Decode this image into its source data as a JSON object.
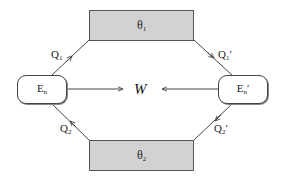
{
  "diagram": {
    "type": "heat-engine-cycle",
    "colors": {
      "reservoir_fill": "#d2d2d2",
      "border": "#555555",
      "line": "#444444",
      "background": "#ffffff"
    },
    "reservoirs": [
      {
        "id": "hot",
        "symbol": "θ",
        "subscript": "1"
      },
      {
        "id": "cold",
        "symbol": "θ",
        "subscript": "2"
      }
    ],
    "engines": [
      {
        "id": "left",
        "symbol": "E",
        "subscript": "n",
        "prime": ""
      },
      {
        "id": "right",
        "symbol": "E",
        "subscript": "n",
        "prime": "′"
      }
    ],
    "work": {
      "label": "W"
    },
    "flows": [
      {
        "id": "q1",
        "symbol": "Q",
        "subscript": "1",
        "prime": "",
        "from": "left engine",
        "to": "θ1"
      },
      {
        "id": "q1p",
        "symbol": "Q",
        "subscript": "1",
        "prime": "′",
        "from": "θ1",
        "to": "right engine"
      },
      {
        "id": "q2",
        "symbol": "Q",
        "subscript": "2",
        "prime": "",
        "from": "θ2",
        "to": "left engine"
      },
      {
        "id": "q2p",
        "symbol": "Q",
        "subscript": "2",
        "prime": "′",
        "from": "right engine",
        "to": "θ2"
      }
    ]
  }
}
